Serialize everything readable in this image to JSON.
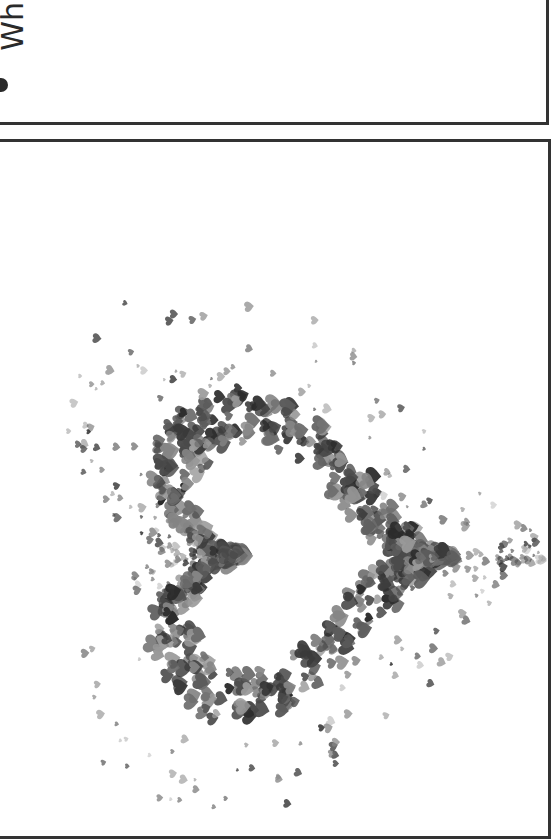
{
  "top_panel": {
    "rotated_text": "Wh",
    "bullet": "•"
  },
  "bottom_panel": {
    "image_label": "heart-shaped cluster of small hearts",
    "heart_shape": {
      "center_x": 280,
      "center_y": 555,
      "orientation": "rotated 90deg, point facing right",
      "inner_radius": 118,
      "band_width": 70,
      "scatter_radius": 230
    },
    "particle_glyph": "♥",
    "particle_colors": [
      "#2b2b2b",
      "#3a3a3a",
      "#4a4a4a",
      "#5c5c5c",
      "#6e6e6e",
      "#858585",
      "#9a9a9a"
    ],
    "particle_count": 900
  },
  "colors": {
    "background": "#ffffff",
    "border": "#333333",
    "text": "#2a2a2a"
  }
}
